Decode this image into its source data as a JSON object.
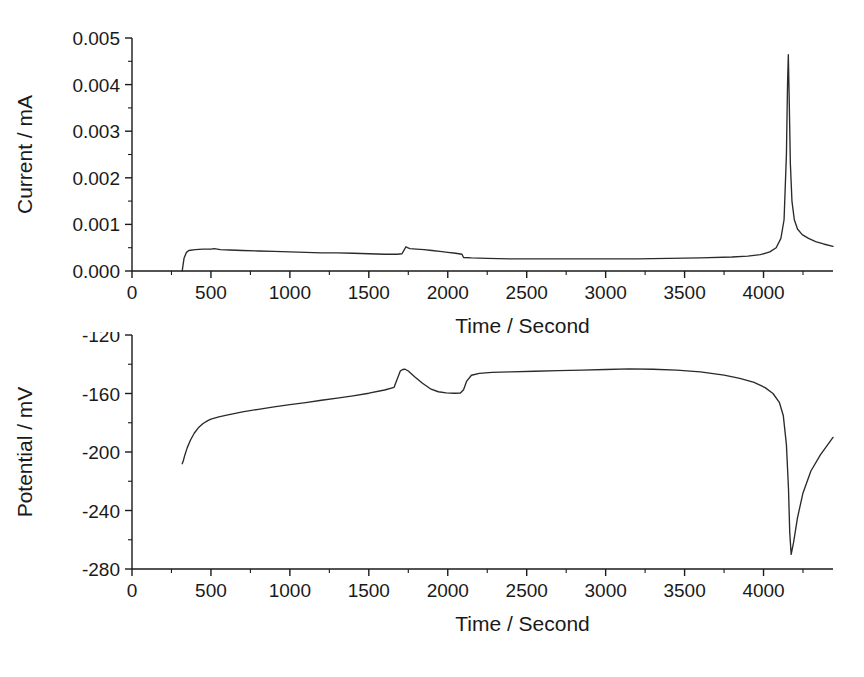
{
  "figure": {
    "title": "",
    "background": "#ffffff",
    "curve_color": "#2a2a2a",
    "axis_color": "#1a1a1a"
  },
  "panels": [
    {
      "id": "current-panel",
      "ylabel": "Current / mA",
      "xlabel": "Time / Second",
      "ylim": [
        0.0,
        0.005
      ],
      "xlim": [
        0,
        4440
      ],
      "ytick_labels": [
        "0.000",
        "0.001",
        "0.002",
        "0.003",
        "0.004",
        "0.005"
      ],
      "ytick_values": [
        0.0,
        0.001,
        0.002,
        0.003,
        0.004,
        0.005
      ],
      "xtick_labels": [
        "0",
        "500",
        "1000",
        "1500",
        "2000",
        "2500",
        "3000",
        "3500",
        "4000"
      ],
      "xtick_values": [
        0,
        500,
        1000,
        1500,
        2000,
        2500,
        3000,
        3500,
        4000
      ],
      "minor_ticks_per_major": 2
    },
    {
      "id": "potential-panel",
      "ylabel": "Potential / mV",
      "xlabel": "Time / Second",
      "ylim": [
        -280,
        -120
      ],
      "xlim": [
        0,
        4440
      ],
      "ytick_labels": [
        "-280",
        "-240",
        "-200",
        "-160",
        "-120"
      ],
      "ytick_values": [
        -280,
        -240,
        -200,
        -160,
        -120
      ],
      "xtick_labels": [
        "0",
        "500",
        "1000",
        "1500",
        "2000",
        "2500",
        "3000",
        "3500",
        "4000"
      ],
      "xtick_values": [
        0,
        500,
        1000,
        1500,
        2000,
        2500,
        3000,
        3500,
        4000
      ],
      "minor_ticks_per_major": 2
    }
  ],
  "chart_data": [
    {
      "type": "line",
      "title": "",
      "xlabel": "Time / Second",
      "ylabel": "Current / mA",
      "xlim": [
        0,
        4440
      ],
      "ylim": [
        0.0,
        0.005
      ],
      "grid": false,
      "legend": "none",
      "xticks": [
        0,
        500,
        1000,
        1500,
        2000,
        2500,
        3000,
        3500,
        4000
      ],
      "yticks": [
        0.0,
        0.001,
        0.002,
        0.003,
        0.004,
        0.005
      ],
      "series": [
        {
          "name": "Current",
          "x": [
            318,
            322,
            330,
            345,
            360,
            400,
            450,
            500,
            520,
            560,
            620,
            700,
            800,
            900,
            1000,
            1100,
            1200,
            1300,
            1400,
            1500,
            1600,
            1680,
            1710,
            1725,
            1735,
            1745,
            1760,
            1800,
            1850,
            1900,
            1950,
            2000,
            2050,
            2090,
            2100,
            2150,
            2250,
            2400,
            2600,
            2800,
            3000,
            3200,
            3400,
            3600,
            3800,
            3900,
            3980,
            4040,
            4080,
            4110,
            4130,
            4145,
            4152,
            4157,
            4162,
            4170,
            4180,
            4195,
            4215,
            4245,
            4285,
            4330,
            4380,
            4440
          ],
          "y": [
            0.0,
            0.0001,
            0.00028,
            0.0004,
            0.00044,
            0.00046,
            0.00047,
            0.00047,
            0.00048,
            0.00046,
            0.00045,
            0.00044,
            0.00043,
            0.00042,
            0.00041,
            0.0004,
            0.00039,
            0.00039,
            0.00038,
            0.00037,
            0.00036,
            0.00036,
            0.00037,
            0.00046,
            0.00052,
            0.0005,
            0.00048,
            0.00047,
            0.00046,
            0.00044,
            0.00042,
            0.0004,
            0.00038,
            0.00036,
            0.00029,
            0.00028,
            0.00027,
            0.00026,
            0.00026,
            0.00026,
            0.00026,
            0.00026,
            0.00027,
            0.00028,
            0.0003,
            0.00032,
            0.00035,
            0.00041,
            0.0005,
            0.0007,
            0.0011,
            0.0025,
            0.004,
            0.00464,
            0.0038,
            0.0023,
            0.0015,
            0.0011,
            0.0009,
            0.00078,
            0.0007,
            0.00063,
            0.00058,
            0.00053
          ]
        }
      ],
      "annotations": [
        {
          "text": "peak",
          "x": 4157,
          "y": 0.00464
        }
      ]
    },
    {
      "type": "line",
      "title": "",
      "xlabel": "Time / Second",
      "ylabel": "Potential / mV",
      "xlim": [
        0,
        4440
      ],
      "ylim": [
        -280,
        -120
      ],
      "grid": false,
      "legend": "none",
      "xticks": [
        0,
        500,
        1000,
        1500,
        2000,
        2500,
        3000,
        3500,
        4000
      ],
      "yticks": [
        -280,
        -240,
        -200,
        -160,
        -120
      ],
      "series": [
        {
          "name": "Potential",
          "x": [
            318,
            325,
            335,
            350,
            370,
            395,
            420,
            450,
            480,
            500,
            550,
            600,
            700,
            800,
            900,
            1000,
            1100,
            1200,
            1300,
            1400,
            1500,
            1600,
            1660,
            1700,
            1715,
            1730,
            1750,
            1790,
            1840,
            1890,
            1940,
            1990,
            2040,
            2080,
            2100,
            2120,
            2150,
            2200,
            2280,
            2400,
            2550,
            2700,
            2850,
            3000,
            3150,
            3300,
            3450,
            3600,
            3750,
            3850,
            3940,
            4010,
            4060,
            4100,
            4125,
            4145,
            4158,
            4166,
            4175,
            4190,
            4215,
            4250,
            4300,
            4360,
            4440
          ],
          "y": [
            -208.0,
            -206.0,
            -202.0,
            -197.0,
            -192.0,
            -187.0,
            -183.5,
            -180.5,
            -178.5,
            -177.5,
            -176.0,
            -174.8,
            -172.6,
            -170.8,
            -169.2,
            -167.6,
            -166.2,
            -164.6,
            -163.2,
            -161.6,
            -159.8,
            -157.6,
            -155.8,
            -144.5,
            -143.6,
            -143.4,
            -144.6,
            -148.5,
            -153.0,
            -156.8,
            -158.8,
            -159.6,
            -159.8,
            -159.7,
            -157.5,
            -151.5,
            -147.5,
            -146.2,
            -145.6,
            -145.2,
            -144.8,
            -144.4,
            -144.0,
            -143.6,
            -143.2,
            -143.4,
            -144.0,
            -145.2,
            -147.4,
            -149.6,
            -152.4,
            -156.0,
            -160.0,
            -166.0,
            -175.0,
            -195.0,
            -225.0,
            -255.0,
            -270.0,
            -262.0,
            -245.0,
            -228.0,
            -213.0,
            -202.0,
            -190.0
          ]
        }
      ],
      "annotations": [
        {
          "text": "dip",
          "x": 4175,
          "y": -270
        }
      ]
    }
  ]
}
